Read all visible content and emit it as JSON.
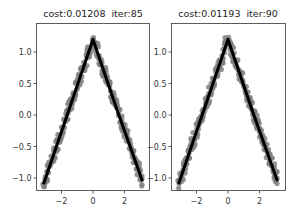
{
  "figure": {
    "panels": [
      {
        "title_cost": "cost:0.01208",
        "title_iter": "iter:85",
        "title": "cost:0.01208  iter:85"
      },
      {
        "title_cost": "cost:0.01193",
        "title_iter": "iter:90",
        "title": "cost:0.01193  iter:90"
      }
    ],
    "colors": {
      "scatter": "#808080",
      "line": "#000000",
      "axes": "#333333"
    }
  },
  "chart_data": [
    {
      "type": "scatter",
      "title": "cost:0.01208  iter:85",
      "xlabel": "",
      "ylabel": "",
      "xticks": [
        -2,
        0,
        2
      ],
      "xtick_labels": [
        "−2",
        "0",
        "2"
      ],
      "yticks": [
        -1.0,
        -0.5,
        0.0,
        0.5,
        1.0
      ],
      "ytick_labels": [
        "−1.0",
        "−0.5",
        "0.0",
        "0.5",
        "1.0"
      ],
      "xlim": [
        -3.5,
        3.6
      ],
      "ylim": [
        -1.2,
        1.38
      ],
      "grid": false,
      "legend": null,
      "series": [
        {
          "name": "data",
          "kind": "scatter",
          "color": "#808080",
          "description": "noisy samples of a triangular peak, x from -3.14 to 3.14, noise ~±0.1"
        },
        {
          "name": "fit",
          "kind": "line",
          "color": "#000000",
          "x": [
            -3.14,
            -1.57,
            0.0,
            1.57,
            3.14
          ],
          "y": [
            -1.1,
            0.05,
            1.2,
            0.05,
            -1.05
          ]
        }
      ]
    },
    {
      "type": "scatter",
      "title": "cost:0.01193  iter:90",
      "xlabel": "",
      "ylabel": "",
      "xticks": [
        -2,
        0,
        2
      ],
      "xtick_labels": [
        "−2",
        "0",
        "2"
      ],
      "yticks": [
        -1.0,
        -0.5,
        0.0,
        0.5,
        1.0
      ],
      "ytick_labels": [
        "−1.0",
        "−0.5",
        "0.0",
        "0.5",
        "1.0"
      ],
      "xlim": [
        -3.5,
        3.6
      ],
      "ylim": [
        -1.2,
        1.38
      ],
      "grid": false,
      "legend": null,
      "series": [
        {
          "name": "data",
          "kind": "scatter",
          "color": "#808080",
          "description": "noisy samples of a triangular peak, x from -3.14 to 3.14, noise ~±0.1"
        },
        {
          "name": "fit",
          "kind": "line",
          "color": "#000000",
          "x": [
            -3.14,
            -1.57,
            0.0,
            1.57,
            3.14
          ],
          "y": [
            -1.1,
            0.05,
            1.2,
            0.05,
            -1.05
          ]
        }
      ]
    }
  ]
}
